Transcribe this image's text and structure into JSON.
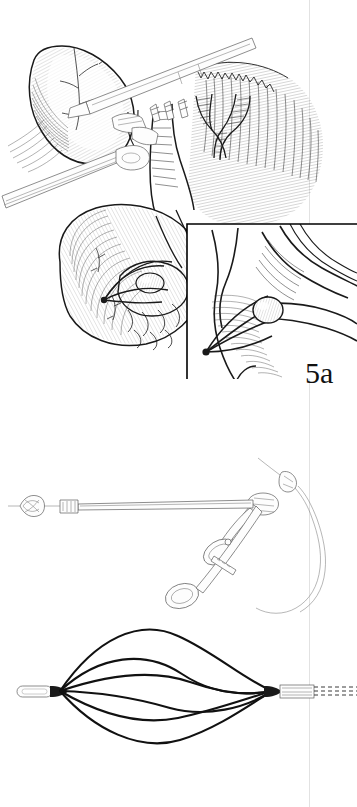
{
  "figure": {
    "domain": "medical-surgical-illustration",
    "style": "pen-and-ink line drawing, black on white",
    "page_width": 357,
    "page_height": 807,
    "background_color": "#ffffff",
    "ink_color": "#1a1a1a",
    "gutter_color": "#e2e2e2",
    "gutter_x": 309
  },
  "panels": [
    {
      "id": "5a",
      "label": "5a",
      "label_x": 305,
      "label_y": 358,
      "caption": "",
      "bounds": {
        "x": 0,
        "y": 0,
        "width": 357,
        "height": 400
      },
      "subject": "Laparoscopic view of the hepatoduodenal region during transcystic bile duct exploration",
      "structures": [
        {
          "name": "gallbladder",
          "note": "retracted upward at upper left, cross-hatched serosal surface with visible vessels"
        },
        {
          "name": "cystic-duct",
          "note": "opened transversely, instrument entering"
        },
        {
          "name": "common-bile-duct",
          "note": "descending toward duodenum"
        },
        {
          "name": "hepatic-duct-branches",
          "note": "bifurcating ductal tree with ladder hatching at upper right"
        },
        {
          "name": "duodenum",
          "note": "large hatched organ at lower centre"
        },
        {
          "name": "liver-bed",
          "note": "hatched background tissue at right"
        },
        {
          "name": "grasping-forceps",
          "note": "two straight laparoscopic shafts entering from upper right and left"
        },
        {
          "name": "dissecting-clamp",
          "note": "jaws applied at the cystic duct junction"
        },
        {
          "name": "stone-in-basket",
          "note": "calculus engaged by wire basket within the duct lumen at lower centre"
        }
      ],
      "inset": {
        "name": "magnified-inset",
        "bounds": {
          "x": 186,
          "y": 222,
          "width": 171,
          "height": 156
        },
        "frame_sides": [
          "top",
          "left"
        ],
        "frame_color": "#000000",
        "subject": "Close-up of the stone captured within the Dormia basket inside the common bile duct"
      }
    },
    {
      "id": "5b",
      "label": "5b",
      "label_x": 303,
      "label_y": 740,
      "caption": "",
      "bounds": {
        "x": 0,
        "y": 400,
        "width": 357,
        "height": 407
      },
      "subject": "The stone-retrieval instrumentation: flexible catheter with Dormia basket and ring-handled introducer",
      "components": [
        {
          "name": "guidewire",
          "note": "thin wire curving from upper right down to the handle"
        },
        {
          "name": "guidewire-hub",
          "note": "small knurled connector on the wire"
        },
        {
          "name": "catheter-shaft",
          "note": "long straight sheath running leftward"
        },
        {
          "name": "basket-closed",
          "note": "collapsed wire basket at the distal tip, left end"
        },
        {
          "name": "sliding-collar",
          "note": "small metal collar along the shaft"
        },
        {
          "name": "ring-handle-forceps",
          "note": "scissor-style handle with two finger rings and ratchet at right"
        }
      ],
      "basket_deployed": {
        "name": "dormia-basket-expanded",
        "note": "four helical nitinol wires forming an open spiral cage",
        "wire_count": 4,
        "distal_tip": "rounded atraumatic leader",
        "proximal_sheath": "striped metal cannula exiting right edge"
      }
    }
  ]
}
